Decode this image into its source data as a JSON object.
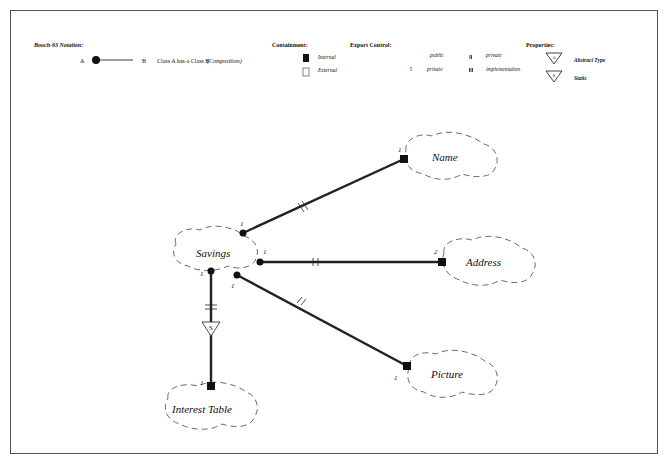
{
  "legend": {
    "notation": {
      "title": "Booch-93 Notation:",
      "a": "A",
      "b": "B",
      "description": "Class A  has-a  Class B",
      "kind": "(Composition)"
    },
    "containment": {
      "title": "Containment:",
      "items": [
        {
          "symbol": "filled-square",
          "label": "Internal"
        },
        {
          "symbol": "open-square",
          "label": "External"
        }
      ]
    },
    "export_control": {
      "title": "Export Control:",
      "items": [
        {
          "marker": "",
          "label": "public"
        },
        {
          "marker": "I",
          "label": "protected"
        },
        {
          "marker": "II",
          "label": "private"
        },
        {
          "marker": "III",
          "label": "implementation"
        }
      ]
    },
    "properties": {
      "title": "Properties:",
      "items": [
        {
          "glyph": "A",
          "label": "Abstract Type"
        },
        {
          "glyph": "S",
          "label": "Static"
        }
      ]
    }
  },
  "diagram": {
    "classes": [
      {
        "id": "savings",
        "name": "Savings"
      },
      {
        "id": "name",
        "name": "Name"
      },
      {
        "id": "address",
        "name": "Address"
      },
      {
        "id": "picture",
        "name": "Picture"
      },
      {
        "id": "interest_table",
        "name": "Interest Table"
      }
    ],
    "relationships": [
      {
        "from": "savings",
        "to": "name",
        "from_mult": "1",
        "to_mult": "1",
        "export": "II",
        "containment": "Internal"
      },
      {
        "from": "savings",
        "to": "address",
        "from_mult": "1",
        "to_mult": "2",
        "export": "II",
        "containment": "Internal"
      },
      {
        "from": "savings",
        "to": "picture",
        "from_mult": "1",
        "to_mult": "1",
        "export": "II",
        "containment": "Internal"
      },
      {
        "from": "savings",
        "to": "interest_table",
        "from_mult": "1",
        "to_mult": "1",
        "export": "II",
        "containment": "Internal",
        "property": "S"
      }
    ]
  }
}
